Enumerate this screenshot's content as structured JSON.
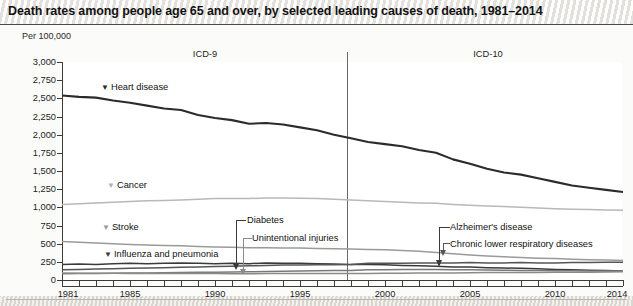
{
  "header": {
    "title": "Death rates among people age 65 and over, by selected leading causes of death, 1981–2014"
  },
  "chart_data": {
    "type": "line",
    "title": "Death rates among people age 65 and over, by selected leading causes of death, 1981–2014",
    "subtitle": "",
    "xlabel": "",
    "ylabel": "Per 100,000",
    "xlim": [
      1981,
      2014
    ],
    "ylim": [
      0,
      3000
    ],
    "ytick_labels": [
      "0",
      "250",
      "500",
      "750",
      "1,000",
      "1,250",
      "1,500",
      "1,750",
      "2,000",
      "2,250",
      "2,500",
      "2,750",
      "3,000"
    ],
    "ytick_values": [
      0,
      250,
      500,
      750,
      1000,
      1250,
      1500,
      1750,
      2000,
      2250,
      2500,
      2750,
      3000
    ],
    "xtick_labels": [
      "1981",
      "1985",
      "1990",
      "1995",
      "2000",
      "2005",
      "2010",
      "2014"
    ],
    "xtick_values": [
      1981,
      1985,
      1990,
      1995,
      2000,
      2005,
      2010,
      2014
    ],
    "grid": false,
    "legend_position": "inline-annotations",
    "annotations": [
      {
        "text": "ICD-9",
        "x": 1990,
        "note": "coding era label, left of break"
      },
      {
        "text": "ICD-10",
        "x": 2006,
        "note": "coding era label, right of break"
      },
      {
        "text": "break",
        "x": 1998.6,
        "note": "vertical line marking ICD-9 to ICD-10 transition"
      }
    ],
    "x": [
      1981,
      1982,
      1983,
      1984,
      1985,
      1986,
      1987,
      1988,
      1989,
      1990,
      1991,
      1992,
      1993,
      1994,
      1995,
      1996,
      1997,
      1998,
      1999,
      2000,
      2001,
      2002,
      2003,
      2004,
      2005,
      2006,
      2007,
      2008,
      2009,
      2010,
      2011,
      2012,
      2013,
      2014
    ],
    "series": [
      {
        "name": "Heart disease",
        "label": "Heart disease",
        "color": "#2b2b2b",
        "marker": "▼",
        "values": [
          2540,
          2520,
          2510,
          2470,
          2440,
          2400,
          2360,
          2340,
          2270,
          2230,
          2200,
          2150,
          2160,
          2140,
          2100,
          2060,
          2000,
          1950,
          1900,
          1870,
          1840,
          1790,
          1750,
          1660,
          1600,
          1530,
          1480,
          1450,
          1400,
          1350,
          1300,
          1270,
          1240,
          1210
        ]
      },
      {
        "name": "Cancer",
        "label": "Cancer",
        "color": "#b8b8b8",
        "marker": "▼",
        "values": [
          1040,
          1050,
          1060,
          1070,
          1080,
          1090,
          1095,
          1100,
          1110,
          1120,
          1120,
          1120,
          1130,
          1130,
          1125,
          1120,
          1110,
          1100,
          1090,
          1080,
          1070,
          1060,
          1055,
          1040,
          1030,
          1020,
          1010,
          1000,
          990,
          980,
          975,
          970,
          965,
          960
        ]
      },
      {
        "name": "Stroke",
        "label": "Stroke",
        "color": "#9a9a9a",
        "marker": "▼",
        "values": [
          530,
          520,
          510,
          500,
          490,
          480,
          475,
          470,
          460,
          455,
          450,
          445,
          445,
          440,
          440,
          435,
          430,
          425,
          420,
          415,
          405,
          395,
          380,
          360,
          345,
          330,
          320,
          310,
          300,
          295,
          285,
          280,
          275,
          270
        ]
      },
      {
        "name": "Influenza and pneumonia",
        "label": "Influenza and pneumonia",
        "color": "#3a3a3a",
        "marker": "▼",
        "values": [
          215,
          220,
          215,
          225,
          230,
          225,
          230,
          235,
          230,
          225,
          230,
          225,
          235,
          230,
          230,
          225,
          220,
          215,
          215,
          210,
          200,
          195,
          190,
          180,
          180,
          170,
          165,
          160,
          155,
          145,
          140,
          135,
          130,
          125
        ]
      },
      {
        "name": "Chronic lower respiratory diseases",
        "label": "Chronic lower respiratory diseases",
        "color": "#555555",
        "marker": "callout",
        "values": [
          140,
          145,
          150,
          155,
          160,
          165,
          170,
          175,
          180,
          185,
          190,
          195,
          200,
          205,
          205,
          210,
          210,
          215,
          230,
          230,
          230,
          235,
          235,
          235,
          240,
          235,
          235,
          240,
          235,
          235,
          240,
          240,
          245,
          245
        ]
      },
      {
        "name": "Diabetes",
        "label": "Diabetes",
        "color": "#7a7a7a",
        "marker": "callout",
        "values": [
          85,
          88,
          90,
          92,
          95,
          98,
          100,
          103,
          105,
          108,
          110,
          112,
          118,
          122,
          125,
          128,
          130,
          132,
          140,
          142,
          145,
          145,
          145,
          142,
          140,
          138,
          135,
          132,
          130,
          128,
          126,
          125,
          124,
          123
        ]
      },
      {
        "name": "Unintentional injuries",
        "label": "Unintentional injuries",
        "color": "#8a8a8a",
        "marker": "callout",
        "values": [
          95,
          93,
          92,
          92,
          90,
          90,
          90,
          90,
          88,
          88,
          87,
          86,
          88,
          88,
          88,
          88,
          88,
          88,
          90,
          92,
          93,
          95,
          97,
          98,
          100,
          102,
          104,
          104,
          104,
          105,
          106,
          108,
          110,
          112
        ]
      }
    ]
  }
}
